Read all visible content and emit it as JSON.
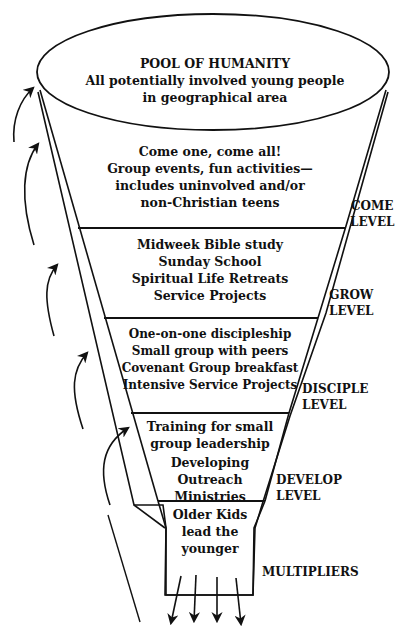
{
  "pool": {
    "title": "POOL OF HUMANITY",
    "lines": [
      "All potentially involved young people",
      "in geographical area"
    ]
  },
  "tiers": [
    {
      "id": "come",
      "lines": [
        "Come one, come all!",
        "Group events, fun activities—",
        "includes uninvolved and/or",
        "non-Christian teens"
      ],
      "level": [
        "COME",
        "LEVEL"
      ]
    },
    {
      "id": "grow",
      "lines": [
        "Midweek Bible study",
        "Sunday School",
        "Spiritual Life Retreats",
        "Service Projects"
      ],
      "level": [
        "GROW",
        "LEVEL"
      ]
    },
    {
      "id": "disciple",
      "lines": [
        "One-on-one discipleship",
        "Small group with peers",
        "Covenant Group breakfast",
        "Intensive Service Projects"
      ],
      "level": [
        "DISCIPLE",
        "LEVEL"
      ]
    },
    {
      "id": "develop",
      "lines": [
        "Training for small",
        "group leadership",
        "Developing",
        "Outreach",
        "Ministries"
      ],
      "level": [
        "DEVELOP",
        "LEVEL"
      ]
    },
    {
      "id": "multipliers",
      "lines": [
        "Older Kids",
        "lead the",
        "younger"
      ],
      "level": [
        "MULTIPLIERS"
      ]
    }
  ],
  "icons": {
    "return_arrows": "curved-up-arrow",
    "output_arrows": "down-arrow"
  },
  "colors": {
    "ink": "#111111",
    "paper": "#ffffff"
  }
}
